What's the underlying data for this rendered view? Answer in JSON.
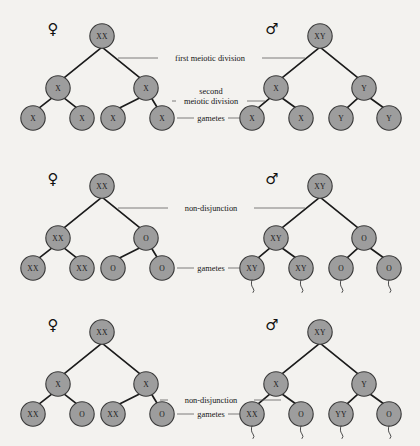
{
  "figure": {
    "background_color": "#f3f2ef",
    "node_fill": "#9d9d9d",
    "node_stroke": "#3a3a3a",
    "edge_color": "#1b1b1b",
    "leader_color": "#5d5d5d"
  },
  "symbols": {
    "female": "♀",
    "male": "♂"
  },
  "panels": [
    {
      "id": "panel-normal-meiosis",
      "name": "normal-meiosis",
      "annotations": [
        {
          "name": "first-meiotic-division-label",
          "text": "first meiotic division"
        },
        {
          "name": "second-meiotic-division-label-line1",
          "text": "second"
        },
        {
          "name": "second-meiotic-division-label-line2",
          "text": "meiotic division"
        },
        {
          "name": "gametes-label",
          "text": "gametes"
        }
      ],
      "female": {
        "sex": "♀",
        "root": "XX",
        "mid": [
          "X",
          "X"
        ],
        "gametes": [
          "X",
          "X",
          "X",
          "X"
        ]
      },
      "male": {
        "sex": "♂",
        "root": "XY",
        "mid": [
          "X",
          "Y"
        ],
        "gametes": [
          "X",
          "X",
          "Y",
          "Y"
        ],
        "gamete_tails": false
      }
    },
    {
      "id": "panel-first-division-nondisjunction",
      "name": "first-division-non-disjunction",
      "annotations": [
        {
          "name": "non-disjunction-label",
          "text": "non-disjunction"
        },
        {
          "name": "gametes-label",
          "text": "gametes"
        }
      ],
      "female": {
        "sex": "♀",
        "root": "XX",
        "mid": [
          "XX",
          "O"
        ],
        "gametes": [
          "XX",
          "XX",
          "O",
          "O"
        ]
      },
      "male": {
        "sex": "♂",
        "root": "XY",
        "mid": [
          "XY",
          "O"
        ],
        "gametes": [
          "XY",
          "XY",
          "O",
          "O"
        ],
        "gamete_tails": true
      }
    },
    {
      "id": "panel-second-division-nondisjunction",
      "name": "second-division-non-disjunction",
      "annotations": [
        {
          "name": "non-disjunction-label",
          "text": "non-disjunction"
        },
        {
          "name": "gametes-label",
          "text": "gametes"
        }
      ],
      "female": {
        "sex": "♀",
        "root": "XX",
        "mid": [
          "X",
          "X"
        ],
        "gametes": [
          "XX",
          "O",
          "XX",
          "O"
        ]
      },
      "male": {
        "sex": "♂",
        "root": "XY",
        "mid": [
          "X",
          "Y"
        ],
        "gametes": [
          "XX",
          "O",
          "YY",
          "O"
        ],
        "gamete_tails": true
      }
    }
  ]
}
